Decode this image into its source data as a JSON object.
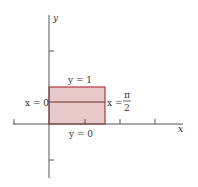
{
  "diagram": {
    "axes": {
      "x_label": "x",
      "y_label": "y"
    },
    "region": {
      "fill": "#e8c4c4",
      "stroke": "#b23a3a"
    },
    "boundaries": {
      "top": "y = 1",
      "bottom": "y = 0",
      "left": "x = 0",
      "right_prefix": "x =",
      "right_num": "π",
      "right_den": "2"
    }
  }
}
